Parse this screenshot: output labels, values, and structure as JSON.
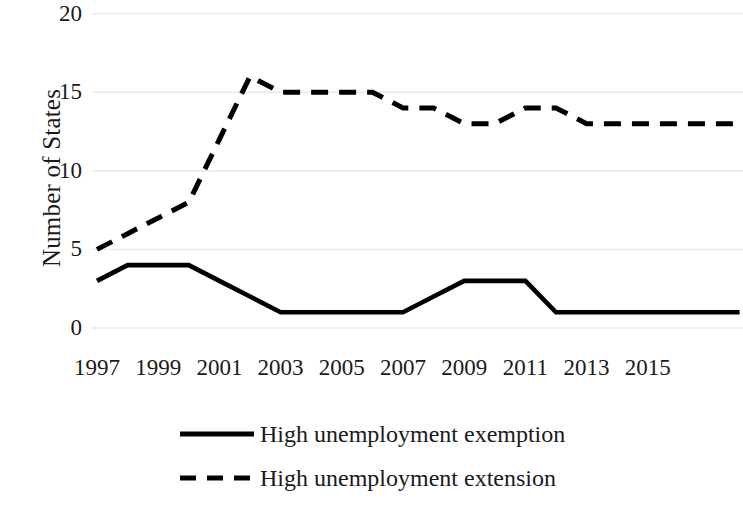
{
  "chart_data": {
    "type": "line",
    "title": "",
    "xlabel": "",
    "ylabel": "Number of States",
    "ylim": [
      0,
      20
    ],
    "yticks": [
      0,
      5,
      10,
      15,
      20
    ],
    "ytick_labels": [
      "0",
      "5",
      "10",
      "15",
      "20"
    ],
    "xlim": [
      1997,
      2018
    ],
    "xticks": [
      1997,
      1999,
      2001,
      2003,
      2005,
      2007,
      2009,
      2011,
      2013,
      2015
    ],
    "xtick_labels": [
      "1997",
      "1999",
      "2001",
      "2003",
      "2005",
      "2007",
      "2009",
      "2011",
      "2013",
      "2015"
    ],
    "grid": true,
    "grid_axis": "y",
    "grid_color": "#e8e8e8",
    "legend_position": "bottom",
    "line_color": "#000000",
    "background_color": "#ffffff",
    "x": [
      1997,
      1998,
      1999,
      2000,
      2001,
      2002,
      2003,
      2004,
      2005,
      2006,
      2007,
      2008,
      2009,
      2010,
      2011,
      2012,
      2013,
      2014,
      2015,
      2016,
      2017,
      2018
    ],
    "series": [
      {
        "name": "High unemployment exemption",
        "style": "solid",
        "values": [
          3,
          4,
          4,
          4,
          3,
          2,
          1,
          1,
          1,
          1,
          1,
          2,
          3,
          3,
          3,
          1,
          1,
          1,
          1,
          1,
          1,
          1
        ]
      },
      {
        "name": "High unemployment extension",
        "style": "dashed",
        "values": [
          5,
          6,
          7,
          8,
          12,
          16,
          15,
          15,
          15,
          15,
          14,
          14,
          13,
          13,
          14,
          14,
          13,
          13,
          13,
          13,
          13,
          13
        ]
      }
    ]
  },
  "legend": {
    "items": [
      {
        "label": "High unemployment exemption",
        "style": "solid"
      },
      {
        "label": "High unemployment extension",
        "style": "dashed"
      }
    ]
  }
}
